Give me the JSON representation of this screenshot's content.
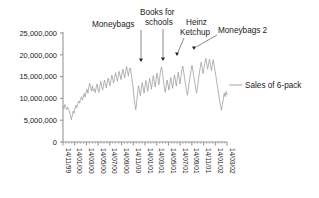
{
  "chart_data": {
    "type": "line",
    "title": "",
    "xlabel": "",
    "ylabel": "",
    "ylim": [
      0,
      25000000
    ],
    "grid": false,
    "legend_position": "right",
    "y_ticks": [
      {
        "value": 25000000,
        "label": "25,000,000"
      },
      {
        "value": 20000000,
        "label": "20,000,000"
      },
      {
        "value": 15000000,
        "label": "15,000,000"
      },
      {
        "value": 10000000,
        "label": "10,000,000"
      },
      {
        "value": 5000000,
        "label": "5,000,000"
      },
      {
        "value": 0,
        "label": "0"
      }
    ],
    "x_tick_labels": [
      "14/11/99",
      "14/01/00",
      "14/03/00",
      "14/05/00",
      "14/07/00",
      "14/09/00",
      "14/11/00",
      "14/01/01",
      "14/03/01",
      "14/05/01",
      "14/07/01",
      "14/09/01",
      "14/11/01",
      "14/01/02",
      "14/03/02"
    ],
    "minor_ticks_per_interval": 3,
    "series": [
      {
        "name": "Sales of 6-pack",
        "color": "#9a9a9a",
        "values": [
          8200000,
          7600000,
          8600000,
          8100000,
          7400000,
          8000000,
          7500000,
          6900000,
          6200000,
          5100000,
          6000000,
          7100000,
          6600000,
          7600000,
          8400000,
          7900000,
          8800000,
          9400000,
          8900000,
          9900000,
          10400000,
          9600000,
          10200000,
          11100000,
          10300000,
          11400000,
          12100000,
          11200000,
          12600000,
          13500000,
          12400000,
          11600000,
          12900000,
          11800000,
          12200000,
          11300000,
          12500000,
          13300000,
          12100000,
          11400000,
          12800000,
          13900000,
          12700000,
          11900000,
          13100000,
          14200000,
          13300000,
          12400000,
          13600000,
          14700000,
          13800000,
          12900000,
          14100000,
          15300000,
          14400000,
          13500000,
          14800000,
          15900000,
          14900000,
          13900000,
          15100000,
          16200000,
          15200000,
          14300000,
          15600000,
          16700000,
          15700000,
          14700000,
          16100000,
          17300000,
          16200000,
          15100000,
          16600000,
          17000000,
          15800000,
          14200000,
          12600000,
          10400000,
          8700000,
          7400000,
          9200000,
          11300000,
          12900000,
          11700000,
          10600000,
          12200000,
          13600000,
          12400000,
          11200000,
          12800000,
          14100000,
          12900000,
          11600000,
          13200000,
          14600000,
          13400000,
          12100000,
          13800000,
          15200000,
          13900000,
          12600000,
          14300000,
          15800000,
          14500000,
          13100000,
          14900000,
          16400000,
          17200000,
          15900000,
          14100000,
          12600000,
          11400000,
          12900000,
          14200000,
          13100000,
          11900000,
          13400000,
          14800000,
          13600000,
          12300000,
          13900000,
          15400000,
          14100000,
          12800000,
          14500000,
          16000000,
          14700000,
          13300000,
          15000000,
          16600000,
          17400000,
          16100000,
          14600000,
          13200000,
          11800000,
          10700000,
          12100000,
          13600000,
          15100000,
          16400000,
          17600000,
          16300000,
          14900000,
          13600000,
          12400000,
          11200000,
          12700000,
          14300000,
          15800000,
          17100000,
          18300000,
          17100000,
          15700000,
          16900000,
          18100000,
          19200000,
          18000000,
          16700000,
          17900000,
          19000000,
          17800000,
          16400000,
          17600000,
          18900000,
          17700000,
          16300000,
          15000000,
          13600000,
          12200000,
          10900000,
          9600000,
          8300000,
          7300000,
          8600000,
          9900000,
          11200000,
          10400000,
          11600000,
          10800000
        ]
      }
    ],
    "annotations": [
      {
        "label": "Moneybags",
        "style": "vertical-arrow"
      },
      {
        "label": "Books for schools",
        "style": "vertical-arrow"
      },
      {
        "label": "Heinz Ketchup",
        "style": "diagonal-arrow"
      },
      {
        "label": "Moneybags 2",
        "style": "diagonal-arrow"
      }
    ]
  },
  "legend": {
    "entries": [
      {
        "label": "Sales of 6-pack",
        "color": "#9a9a9a"
      }
    ]
  }
}
